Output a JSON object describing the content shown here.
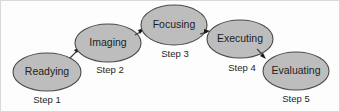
{
  "diagram": {
    "type": "process-flow",
    "background_color": "#fdfdfd",
    "node_fill_color": "#bdbdbd",
    "node_stroke_color": "#4a4a4a",
    "text_color": "#1d1d1d",
    "arrow_color": "#1a1a1a",
    "nodes": [
      {
        "id": "readying",
        "label": "Readying",
        "step_label": "Step 1",
        "cx": 47,
        "cy": 72,
        "rx": 34,
        "ry": 19,
        "step_x": 47,
        "step_y": 100
      },
      {
        "id": "imaging",
        "label": "Imaging",
        "step_label": "Step 2",
        "cx": 108,
        "cy": 43,
        "rx": 33,
        "ry": 19,
        "step_x": 110,
        "step_y": 70
      },
      {
        "id": "focusing",
        "label": "Focusing",
        "step_label": "Step 3",
        "cx": 174,
        "cy": 25,
        "rx": 33,
        "ry": 20,
        "step_x": 175,
        "step_y": 54
      },
      {
        "id": "executing",
        "label": "Executing",
        "step_label": "Step 4",
        "cx": 240,
        "cy": 39,
        "rx": 33,
        "ry": 19,
        "step_x": 242,
        "step_y": 68
      },
      {
        "id": "evaluating",
        "label": "Evaluating",
        "step_label": "Step 5",
        "cx": 296,
        "cy": 71,
        "rx": 33,
        "ry": 19,
        "step_x": 296,
        "step_y": 99
      }
    ],
    "connectors": [
      {
        "id": "readying-to-imaging",
        "from": "readying",
        "to": "imaging",
        "start_x": 70,
        "start_y": 58,
        "end_x": 79,
        "end_y": 49,
        "direction": "up-right"
      },
      {
        "id": "imaging-to-focusing",
        "from": "imaging",
        "to": "focusing",
        "start_x": 134,
        "start_y": 36,
        "end_x": 143,
        "end_y": 30,
        "direction": "up-right"
      },
      {
        "id": "focusing-to-executing",
        "from": "focusing",
        "to": "executing",
        "start_x": 199,
        "start_y": 36,
        "end_x": 209,
        "end_y": 32,
        "direction": "right"
      },
      {
        "id": "executing-to-evaluating",
        "from": "executing",
        "to": "evaluating",
        "start_x": 256,
        "start_y": 49,
        "end_x": 265,
        "end_y": 57,
        "direction": "down-right"
      }
    ]
  }
}
